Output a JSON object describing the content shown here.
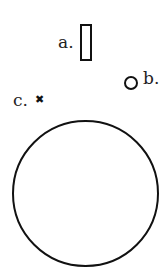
{
  "diagram": {
    "items": [
      {
        "label": "a.",
        "shape": "tall-rectangle"
      },
      {
        "label": "b.",
        "shape": "small-circle"
      },
      {
        "label": "c.",
        "shape": "x-mark",
        "glyph": "✖"
      }
    ],
    "large_shape": "large-circle"
  }
}
